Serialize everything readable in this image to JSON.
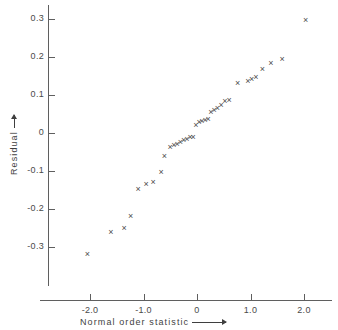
{
  "chart_data": {
    "type": "scatter",
    "title": "",
    "xlabel": "Normal order statistic",
    "ylabel": "Residual",
    "xlim": [
      -2.6,
      2.5
    ],
    "ylim": [
      -0.38,
      0.345
    ],
    "grid": false,
    "legend": "none",
    "marker": "x",
    "marker_color": "#4d4d4d",
    "xticks": [
      -2.0,
      -1.0,
      0,
      1.0,
      2.0
    ],
    "xticklabels": [
      "-2.0",
      "-1.0",
      "0",
      "1.0",
      "2.0"
    ],
    "yticks": [
      0.3,
      0.2,
      0.1,
      0,
      -0.1,
      -0.2,
      -0.3
    ],
    "yticklabels": [
      "0.3",
      "0.2",
      "0.1",
      "0",
      "-0.1",
      "-0.2",
      "-0.3"
    ],
    "x": [
      -2.05,
      -1.61,
      -1.36,
      -1.24,
      -1.1,
      -0.95,
      -0.82,
      -0.67,
      -0.61,
      -0.5,
      -0.43,
      -0.37,
      -0.31,
      -0.25,
      -0.19,
      -0.13,
      -0.07,
      -0.02,
      0.04,
      0.09,
      0.15,
      0.21,
      0.26,
      0.32,
      0.38,
      0.45,
      0.52,
      0.6,
      0.76,
      0.95,
      1.02,
      1.1,
      1.22,
      1.38,
      1.59,
      2.03
    ],
    "y": [
      -0.32,
      -0.262,
      -0.25,
      -0.221,
      -0.148,
      -0.136,
      -0.129,
      -0.104,
      -0.063,
      -0.038,
      -0.033,
      -0.029,
      -0.026,
      -0.021,
      -0.016,
      -0.013,
      -0.011,
      0.02,
      0.027,
      0.031,
      0.033,
      0.035,
      0.055,
      0.058,
      0.064,
      0.073,
      0.082,
      0.086,
      0.13,
      0.136,
      0.14,
      0.146,
      0.168,
      0.184,
      0.194,
      0.296
    ],
    "n_points": 36,
    "x_arrow": true,
    "y_arrow": true
  },
  "axes": {
    "x_title": "Normal order statistic",
    "y_title": "Residual"
  }
}
